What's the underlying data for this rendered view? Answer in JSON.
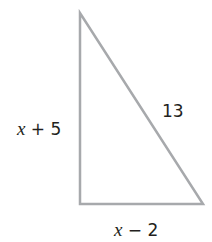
{
  "figure": {
    "shape": "right-triangle",
    "stroke_color": "#a7a9ac",
    "text_color": "#231f20",
    "vertices": {
      "top": [
        80,
        13
      ],
      "bottom_left": [
        80,
        204
      ],
      "bottom_right": [
        203,
        204
      ]
    },
    "labels": {
      "left_side": {
        "var": "x",
        "rest": " + 5"
      },
      "hypotenuse": "13",
      "bottom_side": {
        "var": "x",
        "rest": " − 2"
      }
    }
  }
}
